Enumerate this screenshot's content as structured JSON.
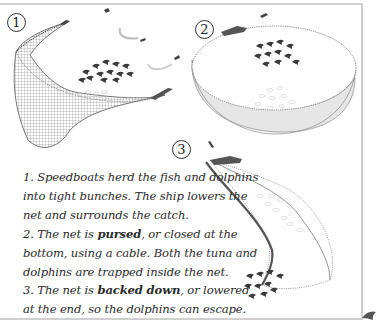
{
  "diagram": {
    "steps": [
      {
        "number": "1",
        "text_before": "1. Speedboats herd the fish and dolphins into tight bunches. The ship lowers the net and surrounds the catch.",
        "bold": "",
        "text_after": ""
      },
      {
        "number": "2",
        "text_before": "2. The net is ",
        "bold": "pursed",
        "text_after": ", or closed at the bottom, using a cable. Both the tuna and dolphins are trapped inside the net."
      },
      {
        "number": "3",
        "text_before": "3. The net is ",
        "bold": "backed down",
        "text_after": ", or lowered at the end, so the dolphins can escape."
      }
    ],
    "illustrations": [
      {
        "step": "1",
        "description": "curved net wall around tuna and dolphins, ship and speedboats"
      },
      {
        "step": "2",
        "description": "bowl-shaped pursed net with dolphins and tuna inside, ship at rim"
      },
      {
        "step": "3",
        "description": "elongated net pulled by ship with dolphins escaping at far end"
      }
    ],
    "colors": {
      "frame": "#cfcfcf",
      "ink": "#2a2a2a",
      "net": "#6b6b6b",
      "dolphin": "#3a3a3a"
    }
  }
}
